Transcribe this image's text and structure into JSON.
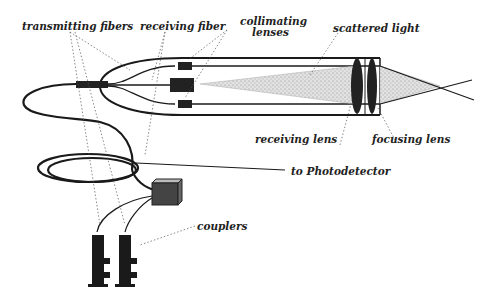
{
  "diagram": {
    "labels": {
      "transmitting_fibers": "transmitting fibers",
      "receiving_fiber": "receiving  fiber",
      "collimating_lenses_1": "collimating",
      "collimating_lenses_2": "lenses",
      "scattered_light": "scattered light",
      "receiving_lens": "receiving lens",
      "focusing_lens": "focusing lens",
      "to_photodetector": "to Photodetector",
      "couplers": "couplers"
    },
    "colors": {
      "ink": "#1a1a1a",
      "beam": "#c8c8c8",
      "background": "#ffffff"
    }
  }
}
